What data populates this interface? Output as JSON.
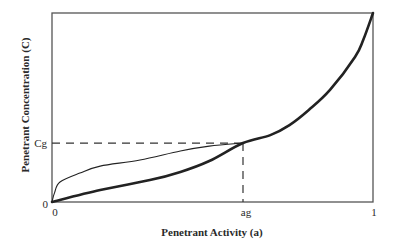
{
  "chart_data": {
    "type": "line",
    "title": "",
    "xlabel": "Penetrant Activity (a)",
    "ylabel": "Penetrant Concentration (C)",
    "xlim": [
      0,
      1
    ],
    "ylim": [
      0,
      1
    ],
    "grid": false,
    "x_ticks": [
      {
        "value": 0,
        "label": "0"
      },
      {
        "value": 0.595,
        "label": "ag"
      },
      {
        "value": 1,
        "label": "1"
      }
    ],
    "y_ticks": [
      {
        "value": 0,
        "label": "0"
      },
      {
        "value": 0.312,
        "label": "Cg"
      }
    ],
    "reference_point": {
      "x": 0.595,
      "y": 0.312,
      "x_label": "ag",
      "y_label": "Cg"
    },
    "series": [
      {
        "name": "convex-isotherm",
        "style": "thick",
        "x": [
          0,
          0.15,
          0.305,
          0.4,
          0.49,
          0.595,
          0.68,
          0.74,
          0.8,
          0.866,
          0.944,
          0.97,
          1.0
        ],
        "y": [
          0,
          0.063,
          0.116,
          0.159,
          0.217,
          0.312,
          0.354,
          0.407,
          0.487,
          0.593,
          0.767,
          0.86,
          1.0
        ]
      },
      {
        "name": "concave-isotherm",
        "style": "thin",
        "x": [
          0,
          0.008,
          0.025,
          0.087,
          0.15,
          0.274,
          0.4,
          0.49,
          0.595
        ],
        "y": [
          0,
          0.05,
          0.106,
          0.153,
          0.19,
          0.222,
          0.27,
          0.296,
          0.312
        ]
      }
    ]
  }
}
